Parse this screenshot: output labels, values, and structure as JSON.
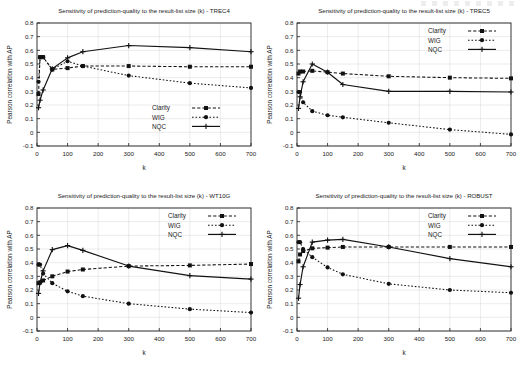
{
  "figure": {
    "x_axis_label": "k",
    "y_axis_label": "Pearson correlation with AP",
    "x_ticks": [
      0,
      100,
      200,
      300,
      400,
      500,
      600,
      700
    ],
    "y_ticks": [
      -0.1,
      0,
      0.1,
      0.2,
      0.3,
      0.4,
      0.5,
      0.6,
      0.7,
      0.8
    ],
    "y_tick_labels": [
      "-0.1",
      "0",
      "0.1",
      "0.2",
      "0.3",
      "0.4",
      "0.5",
      "0.6",
      "0.7",
      "0.8"
    ],
    "x_tick_labels": [
      "0",
      "100",
      "200",
      "300",
      "400",
      "500",
      "600",
      "700"
    ],
    "legend_entries": [
      "Clarity",
      "WIG",
      "NQC"
    ],
    "series_colors": {
      "Clarity": "#111111",
      "WIG": "#111111",
      "NQC": "#111111"
    }
  },
  "chart_data": [
    {
      "type": "line",
      "title": "Sensitivity of prediction-quality to the result-list size (k) - TREC4",
      "dataset": "TREC4",
      "xlabel": "k",
      "ylabel": "Pearson correlation with AP",
      "xlim": [
        0,
        700
      ],
      "ylim": [
        -0.1,
        0.8
      ],
      "grid": true,
      "legend_position": "bottom-right",
      "x": [
        5,
        10,
        20,
        50,
        100,
        150,
        300,
        500,
        700
      ],
      "series": [
        {
          "name": "Clarity",
          "style": "dashed-square",
          "values": [
            0.28,
            0.55,
            0.55,
            0.46,
            0.47,
            0.485,
            0.485,
            0.48,
            0.48
          ]
        },
        {
          "name": "WIG",
          "style": "dotted-circle",
          "values": [
            0.37,
            0.55,
            0.55,
            0.46,
            0.52,
            0.485,
            0.415,
            0.36,
            0.325
          ]
        },
        {
          "name": "NQC",
          "style": "solid-plus",
          "values": [
            0.18,
            0.235,
            0.31,
            0.465,
            0.545,
            0.59,
            0.635,
            0.62,
            0.59
          ]
        }
      ]
    },
    {
      "type": "line",
      "title": "Sensitivity of prediction-quality to the result-list size (k) - TREC5",
      "dataset": "TREC5",
      "xlabel": "k",
      "ylabel": "Pearson correlation with AP",
      "xlim": [
        0,
        700
      ],
      "ylim": [
        -0.1,
        0.8
      ],
      "grid": true,
      "legend_position": "top-right",
      "x": [
        5,
        10,
        20,
        50,
        100,
        150,
        300,
        500,
        700
      ],
      "series": [
        {
          "name": "Clarity",
          "style": "dashed-square",
          "values": [
            0.43,
            0.445,
            0.445,
            0.45,
            0.44,
            0.43,
            0.41,
            0.4,
            0.395
          ]
        },
        {
          "name": "WIG",
          "style": "dotted-circle",
          "values": [
            0.295,
            0.295,
            0.22,
            0.155,
            0.125,
            0.11,
            0.07,
            0.02,
            -0.015
          ]
        },
        {
          "name": "NQC",
          "style": "solid-plus",
          "values": [
            0.175,
            0.26,
            0.37,
            0.5,
            0.44,
            0.35,
            0.3,
            0.3,
            0.295
          ]
        }
      ]
    },
    {
      "type": "line",
      "title": "Sensitivity of prediction-quality to the result-list size (k) - WT10G",
      "dataset": "WT10G",
      "xlabel": "k",
      "ylabel": "Pearson correlation with AP",
      "xlim": [
        0,
        700
      ],
      "ylim": [
        -0.1,
        0.8
      ],
      "grid": true,
      "legend_position": "top-right",
      "x": [
        5,
        10,
        20,
        50,
        100,
        150,
        300,
        500,
        700
      ],
      "series": [
        {
          "name": "Clarity",
          "style": "dashed-square",
          "values": [
            0.25,
            0.255,
            0.27,
            0.3,
            0.335,
            0.35,
            0.375,
            0.38,
            0.39
          ]
        },
        {
          "name": "WIG",
          "style": "dotted-circle",
          "values": [
            0.385,
            0.385,
            0.32,
            0.25,
            0.19,
            0.155,
            0.1,
            0.06,
            0.035
          ]
        },
        {
          "name": "NQC",
          "style": "solid-plus",
          "values": [
            0.175,
            0.255,
            0.34,
            0.495,
            0.525,
            0.49,
            0.375,
            0.305,
            0.28
          ]
        }
      ]
    },
    {
      "type": "line",
      "title": "Sensitivity of prediction-quality to the result-list size (k) - ROBUST",
      "dataset": "ROBUST",
      "xlabel": "k",
      "ylabel": "Pearson correlation with AP",
      "xlim": [
        0,
        700
      ],
      "ylim": [
        -0.1,
        0.8
      ],
      "grid": true,
      "legend_position": "top-right",
      "x": [
        5,
        10,
        20,
        50,
        100,
        150,
        300,
        500,
        700
      ],
      "series": [
        {
          "name": "Clarity",
          "style": "dashed-square",
          "values": [
            0.41,
            0.46,
            0.485,
            0.505,
            0.51,
            0.515,
            0.515,
            0.515,
            0.515
          ]
        },
        {
          "name": "WIG",
          "style": "dotted-circle",
          "values": [
            0.55,
            0.55,
            0.5,
            0.44,
            0.365,
            0.315,
            0.245,
            0.2,
            0.18
          ]
        },
        {
          "name": "NQC",
          "style": "solid-plus",
          "values": [
            0.14,
            0.24,
            0.37,
            0.55,
            0.565,
            0.57,
            0.515,
            0.43,
            0.37
          ]
        }
      ]
    }
  ]
}
